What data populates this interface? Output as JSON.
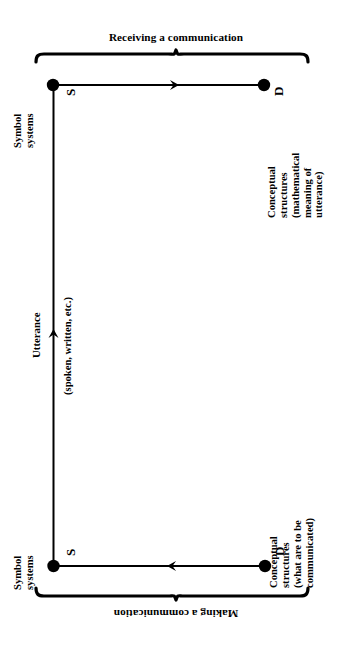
{
  "diagram": {
    "title_top": "Receiving a communication",
    "title_bottom": "Making a communication",
    "nodes": {
      "s_top": "S",
      "d_top": "D",
      "s_bottom": "S",
      "d_bottom": "D"
    },
    "captions": {
      "symbol_systems_top": [
        "Symbol",
        "systems"
      ],
      "symbol_systems_bottom": [
        "Symbol",
        "systems"
      ],
      "conceptual_top": [
        "Conceptual",
        "structures",
        "(mathematical",
        "meaning of",
        "utterance)"
      ],
      "conceptual_bottom": [
        "Conceptual",
        "structures",
        "(what are to be",
        "communicated)"
      ],
      "utterance": "Utterance",
      "utterance_sub": "(spoken, written, etc.)"
    },
    "edges": [
      {
        "name": "top-edge",
        "from": "S",
        "to": "D",
        "direction": "right"
      },
      {
        "name": "bottom-edge",
        "from": "D",
        "to": "S",
        "direction": "left"
      },
      {
        "name": "vertical-edge",
        "from": "S-bottom",
        "to": "S-top",
        "direction": "up"
      }
    ],
    "colors": {
      "ink": "#000000",
      "background": "#ffffff"
    }
  }
}
